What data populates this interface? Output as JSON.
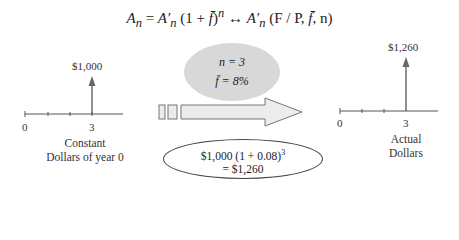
{
  "formula": {
    "lhs": "A",
    "lhs_sub": "n",
    "eq": " = ",
    "rhs1": "A′",
    "rhs1_sub": "n",
    "rhs1_rest": " (1 + ",
    "fbar": "f̄",
    "rhs1_close": ")",
    "rhs1_exp": "n",
    "arrow": "  ↔  ",
    "rhs2": "A′",
    "rhs2_sub": "n",
    "rhs2_rest": " (F / P, ",
    "rhs2_fbar": "f̄",
    "rhs2_close": ", n)"
  },
  "left_diagram": {
    "amount_label": "$1,000",
    "tick_start": "0",
    "tick_end": "3",
    "caption_line1": "Constant",
    "caption_line2": "Dollars of year 0"
  },
  "params": {
    "n_label": "n = 3",
    "f_label": "f̄ = 8%"
  },
  "calculation": {
    "line1": "$1,000 (1 + 0.08)",
    "line1_exp": "3",
    "line2": "= $1,260"
  },
  "right_diagram": {
    "amount_label": "$1,260",
    "tick_start": "0",
    "tick_end": "3",
    "caption_line1": "Actual",
    "caption_line2": "Dollars"
  },
  "colors": {
    "arrow_fill": "#ececec",
    "arrow_stroke": "#777777",
    "ellipse_fill": "#d8d8d8",
    "line": "#555555"
  }
}
